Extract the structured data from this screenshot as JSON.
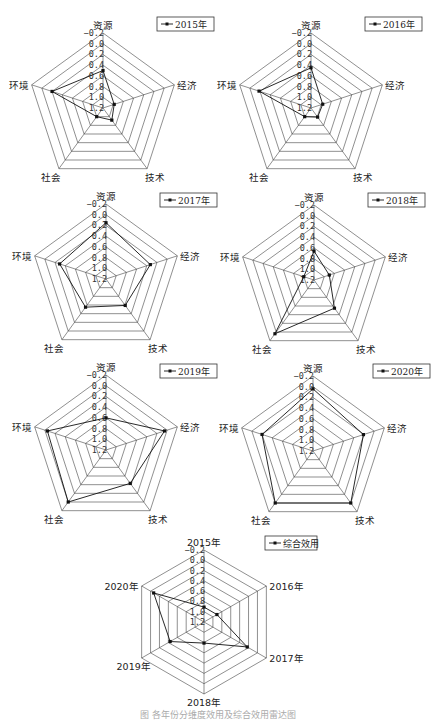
{
  "figure": {
    "caption": "图 各年份分维度效用及综合效用雷达图"
  },
  "scale": {
    "ticks": [
      "-0.2",
      "0.0",
      "0.2",
      "0.4",
      "0.6",
      "0.8",
      "1.0",
      "1.2"
    ],
    "outer": -0.2,
    "center": 1.2
  },
  "chart_data": [
    {
      "type": "radar",
      "title": "2015年",
      "legend": "2015年",
      "categories": [
        "资源",
        "经济",
        "技术",
        "社会",
        "环境"
      ],
      "values": [
        0.5,
        0.98,
        0.92,
        1.0,
        0.2
      ],
      "rlim": [
        1.2,
        -0.2
      ],
      "layout": {
        "cx": 103,
        "cy": 108,
        "r": 75,
        "legend_x": 157,
        "legend_y": 17
      }
    },
    {
      "type": "radar",
      "title": "2016年",
      "legend": "2016年",
      "categories": [
        "资源",
        "经济",
        "技术",
        "社会",
        "环境"
      ],
      "values": [
        0.45,
        0.97,
        0.99,
        1.0,
        0.18
      ],
      "rlim": [
        1.2,
        -0.2
      ],
      "layout": {
        "cx": 311,
        "cy": 108,
        "r": 75,
        "legend_x": 365,
        "legend_y": 17
      }
    },
    {
      "type": "radar",
      "title": "2017年",
      "legend": "2017年",
      "categories": [
        "资源",
        "经济",
        "技术",
        "社会",
        "环境"
      ],
      "values": [
        0.15,
        0.33,
        0.59,
        0.55,
        0.29
      ],
      "rlim": [
        1.2,
        -0.2
      ],
      "layout": {
        "cx": 106,
        "cy": 279,
        "r": 75,
        "legend_x": 160,
        "legend_y": 193
      }
    },
    {
      "type": "radar",
      "title": "2018年",
      "legend": "2018年",
      "categories": [
        "资源",
        "经济",
        "技术",
        "社会",
        "环境"
      ],
      "values": [
        0.66,
        0.9,
        0.55,
        -0.04,
        1.0
      ],
      "rlim": [
        1.2,
        -0.2
      ],
      "layout": {
        "cx": 314,
        "cy": 280,
        "r": 75,
        "legend_x": 368,
        "legend_y": 193
      }
    },
    {
      "type": "radar",
      "title": "2019年",
      "legend": "2019年",
      "categories": [
        "资源",
        "经济",
        "技术",
        "社会",
        "环境"
      ],
      "values": [
        0.6,
        0.05,
        0.43,
        0.0,
        0.05
      ],
      "rlim": [
        1.2,
        -0.2
      ],
      "layout": {
        "cx": 106,
        "cy": 450,
        "r": 75,
        "legend_x": 160,
        "legend_y": 364
      }
    },
    {
      "type": "radar",
      "title": "2020年",
      "legend": "2020年",
      "categories": [
        "资源",
        "经济",
        "技术",
        "社会",
        "环境"
      ],
      "values": [
        0.04,
        0.21,
        0.0,
        0.0,
        0.2
      ],
      "rlim": [
        1.2,
        -0.2
      ],
      "layout": {
        "cx": 313,
        "cy": 451,
        "r": 75,
        "legend_x": 373,
        "legend_y": 364
      }
    },
    {
      "type": "radar",
      "title": "综合效用",
      "legend": "综合效用",
      "categories": [
        "2015年",
        "2016年",
        "2017年",
        "2018年",
        "2019年",
        "2020年"
      ],
      "values": [
        0.91,
        0.91,
        0.23,
        0.79,
        0.44,
        0.07
      ],
      "rlim": [
        1.2,
        -0.2
      ],
      "layout": {
        "cx": 204,
        "cy": 622,
        "r": 72,
        "legend_x": 265,
        "legend_y": 536
      }
    }
  ]
}
